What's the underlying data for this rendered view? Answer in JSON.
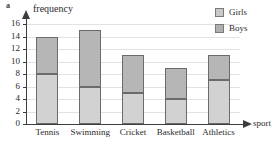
{
  "part_label": "a",
  "chart_data": {
    "type": "bar",
    "title": "",
    "subtitle": "",
    "stacked": true,
    "orientation": "vertical",
    "xlabel": "sport",
    "ylabel": "frequency",
    "ylim": [
      0,
      16
    ],
    "ytick_step": 2,
    "yticks": [
      0,
      2,
      4,
      6,
      8,
      10,
      12,
      14,
      16
    ],
    "ytick_labels": [
      "0",
      "2",
      "4",
      "6",
      "8",
      "10",
      "12",
      "14",
      "16"
    ],
    "grid": true,
    "grid_axis": "y",
    "categories": [
      "Tennis",
      "Swimming",
      "Cricket",
      "Basketball",
      "Athletics"
    ],
    "series": [
      {
        "name": "Boys",
        "color": "#d2d2d2",
        "stack_position": "bottom",
        "values": [
          8,
          6,
          5,
          4,
          7
        ]
      },
      {
        "name": "Girls",
        "color": "#b6b6b6",
        "stack_position": "top",
        "values": [
          6,
          9,
          6,
          5,
          4
        ]
      }
    ],
    "totals": [
      14,
      15,
      11,
      9,
      11
    ],
    "legend": {
      "position": "top-right",
      "entries": [
        {
          "label": "Girls",
          "color": "#c9c9c9"
        },
        {
          "label": "Boys",
          "color": "#b0b0b0"
        }
      ]
    }
  },
  "axes": {
    "y_title": "frequency",
    "x_title": "sport"
  },
  "colors": {
    "axis": "#3d3d3d",
    "grid": "#e2e2e2",
    "bar_border": "#6b6b6b",
    "girls_fill": "#b6b6b6",
    "boys_fill": "#d2d2d2",
    "text": "#2b2b2b",
    "background": "#ffffff"
  }
}
